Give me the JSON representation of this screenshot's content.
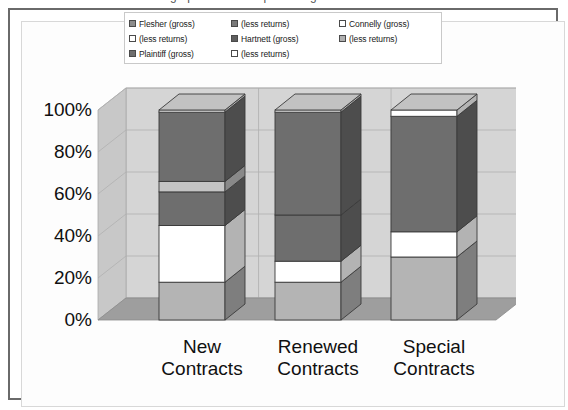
{
  "figure": {
    "frame_border_color": "#6a6a6a",
    "background": "#ffffff",
    "clipped_top_text": "graph of contract percentages"
  },
  "legend": {
    "position": "top",
    "columns": 3,
    "items": [
      {
        "label": "Flesher (gross)",
        "color": "#8c8c8c",
        "column": 1,
        "row": 1
      },
      {
        "label": "(less returns)",
        "color": "#ffffff",
        "column": 1,
        "row": 2
      },
      {
        "label": "Plaintiff (gross)",
        "color": "#6e6e6e",
        "column": 1,
        "row": 3
      },
      {
        "label": "(less returns)",
        "color": "#7a7a7a",
        "column": 2,
        "row": 1
      },
      {
        "label": "Hartnett (gross)",
        "color": "#5e5e5e",
        "column": 2,
        "row": 2
      },
      {
        "label": "(less returns)",
        "color": "#ffffff",
        "column": 2,
        "row": 3
      },
      {
        "label": "Connelly (gross)",
        "color": "#ffffff",
        "column": 3,
        "row": 1
      },
      {
        "label": "(less returns)",
        "color": "#b0b0b0",
        "column": 3,
        "row": 2
      }
    ]
  },
  "chart_data": {
    "type": "bar",
    "subtype": "100%-stacked-column-3d",
    "title": "",
    "xlabel": "",
    "ylabel": "",
    "ylim": [
      0,
      100
    ],
    "yticks": [
      "0%",
      "20%",
      "40%",
      "60%",
      "80%",
      "100%"
    ],
    "ytick_values": [
      0,
      20,
      40,
      60,
      80,
      100
    ],
    "grid": true,
    "categories": [
      "New Contracts",
      "Renewed Contracts",
      "Special Contracts"
    ],
    "category_lines": [
      [
        "New",
        "Contracts"
      ],
      [
        "Renewed",
        "Contracts"
      ],
      [
        "Special",
        "Contracts"
      ]
    ],
    "series": [
      {
        "name": "Flesher (gross)",
        "color": "#b4b4b4",
        "values": [
          18,
          18,
          30
        ]
      },
      {
        "name": "Flesher (less returns)",
        "color": "#ffffff",
        "values": [
          27,
          10,
          12
        ]
      },
      {
        "name": "Plaintiff (gross)",
        "color": "#6e6e6e",
        "values": [
          16,
          22,
          58
        ]
      },
      {
        "name": "Plaintiff (less returns)",
        "color": "#c0c0c0",
        "values": [
          5,
          0,
          0
        ]
      },
      {
        "name": "Hartnett (gross)",
        "color": "#6e6e6e",
        "values": [
          34,
          50,
          0
        ]
      }
    ],
    "bar_stacks": [
      {
        "category": "New Contracts",
        "segments": [
          {
            "from": 0,
            "to": 18,
            "color": "#b4b4b4",
            "series": "Flesher (gross)"
          },
          {
            "from": 18,
            "to": 45,
            "color": "#ffffff",
            "series": "Flesher (less returns)"
          },
          {
            "from": 45,
            "to": 61,
            "color": "#6e6e6e",
            "series": "Plaintiff (gross)"
          },
          {
            "from": 61,
            "to": 66,
            "color": "#c4c4c4",
            "series": "Plaintiff (less returns)"
          },
          {
            "from": 66,
            "to": 99,
            "color": "#6e6e6e",
            "series": "Hartnett (gross)"
          },
          {
            "from": 99,
            "to": 100,
            "color": "#ffffff",
            "series": "Hartnett (less returns)"
          }
        ]
      },
      {
        "category": "Renewed Contracts",
        "segments": [
          {
            "from": 0,
            "to": 18,
            "color": "#b4b4b4",
            "series": "Flesher (gross)"
          },
          {
            "from": 18,
            "to": 28,
            "color": "#ffffff",
            "series": "Flesher (less returns)"
          },
          {
            "from": 28,
            "to": 50,
            "color": "#6e6e6e",
            "series": "Plaintiff (gross)"
          },
          {
            "from": 50,
            "to": 99,
            "color": "#6e6e6e",
            "series": "Hartnett (gross)"
          },
          {
            "from": 99,
            "to": 100,
            "color": "#ffffff",
            "series": "Hartnett (less returns)"
          }
        ]
      },
      {
        "category": "Special Contracts",
        "segments": [
          {
            "from": 0,
            "to": 30,
            "color": "#b4b4b4",
            "series": "Flesher (gross)"
          },
          {
            "from": 30,
            "to": 42,
            "color": "#ffffff",
            "series": "Flesher (less returns)"
          },
          {
            "from": 42,
            "to": 97,
            "color": "#6e6e6e",
            "series": "Plaintiff (gross)"
          },
          {
            "from": 97,
            "to": 100,
            "color": "#ffffff",
            "series": "Connelly (gross)"
          }
        ]
      }
    ],
    "palette": {
      "wall_back": "#d5d5d5",
      "wall_side": "#c8c8c8",
      "floor": "#9e9e9e",
      "grid_line": "#b0b0b0",
      "bar_front": "#6e6e6e",
      "bar_side": "#4e4e4e",
      "bar_top": "#c2c2c2",
      "outline": "#3a3a3a"
    }
  }
}
